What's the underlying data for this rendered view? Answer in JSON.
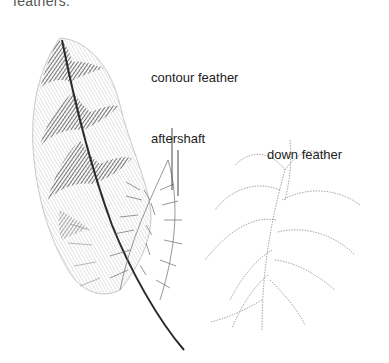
{
  "figure": {
    "caption_fragment": "feathers.",
    "labels": {
      "contour": "contour feather",
      "aftershaft": "aftershaft",
      "down": "down feather"
    },
    "colors": {
      "ink_dark": "#2a2a2a",
      "ink_mid": "#6b6b6b",
      "ink_light": "#a8a8a8",
      "background": "#ffffff"
    }
  }
}
